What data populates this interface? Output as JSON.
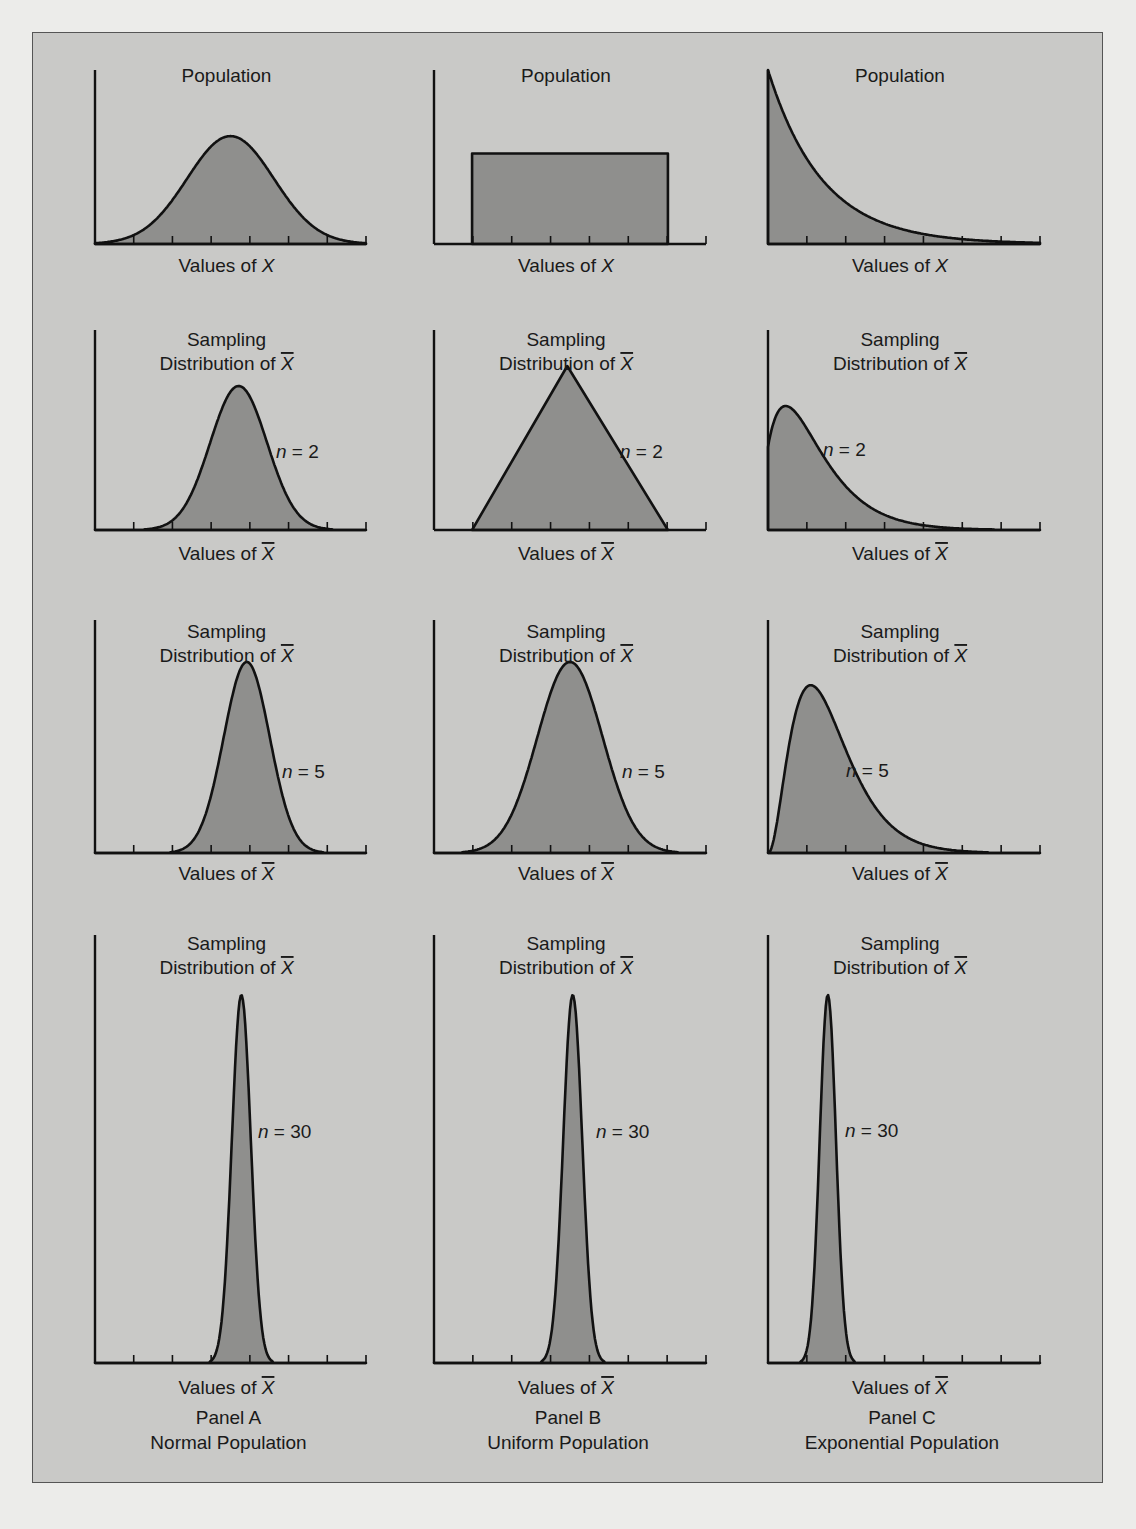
{
  "figure": {
    "columns": [
      {
        "panel": "Panel A",
        "population": "Normal Population"
      },
      {
        "panel": "Panel B",
        "population": "Uniform Population"
      },
      {
        "panel": "Panel C",
        "population": "Exponential Population"
      }
    ],
    "colors": {
      "fill": "#8f8f8d",
      "line": "#111111",
      "frame_bg": "#c9c9c7",
      "page_bg": "#ececea"
    }
  },
  "chart_data": [
    {
      "type": "area",
      "panel": "A",
      "row": 1,
      "title": "Population",
      "xlabel": "Values of X",
      "n": null,
      "shape": "normal",
      "peak_x_frac": 0.5,
      "spread": 0.16,
      "height_frac": 0.62
    },
    {
      "type": "area",
      "panel": "B",
      "row": 1,
      "title": "Population",
      "xlabel": "Values of X",
      "n": null,
      "shape": "uniform",
      "start_frac": 0.14,
      "end_frac": 0.86,
      "height_frac": 0.52
    },
    {
      "type": "area",
      "panel": "C",
      "row": 1,
      "title": "Population",
      "xlabel": "Values of X",
      "n": null,
      "shape": "exponential",
      "rate": 5.0,
      "height_frac": 1.0
    },
    {
      "type": "area",
      "panel": "A",
      "row": 2,
      "title": "Sampling Distribution of X̄",
      "xlabel": "Values of X̄",
      "n": 2,
      "shape": "normal",
      "peak_x_frac": 0.53,
      "spread": 0.105,
      "height_frac": 0.72
    },
    {
      "type": "area",
      "panel": "B",
      "row": 2,
      "title": "Sampling Distribution of X̄",
      "xlabel": "Values of X̄",
      "n": 2,
      "shape": "triangular",
      "start_frac": 0.14,
      "peak_x_frac": 0.49,
      "end_frac": 0.86,
      "height_frac": 0.82
    },
    {
      "type": "area",
      "panel": "C",
      "row": 2,
      "title": "Sampling Distribution of X̄",
      "xlabel": "Values of X̄",
      "n": 2,
      "shape": "gamma2",
      "peak_x_frac": 0.06,
      "height_frac": 0.62
    },
    {
      "type": "area",
      "panel": "A",
      "row": 3,
      "title": "Sampling Distribution of X̄",
      "xlabel": "Values of X̄",
      "n": 5,
      "shape": "normal",
      "peak_x_frac": 0.56,
      "spread": 0.085,
      "height_frac": 0.82
    },
    {
      "type": "area",
      "panel": "B",
      "row": 3,
      "title": "Sampling Distribution of X̄",
      "xlabel": "Values of X̄",
      "n": 5,
      "shape": "normal",
      "peak_x_frac": 0.5,
      "spread": 0.12,
      "height_frac": 0.82
    },
    {
      "type": "area",
      "panel": "C",
      "row": 3,
      "title": "Sampling Distribution of X̄",
      "xlabel": "Values of X̄",
      "n": 5,
      "shape": "gamma5",
      "peak_x_frac": 0.12,
      "height_frac": 0.72
    },
    {
      "type": "area",
      "panel": "A",
      "row": 4,
      "title": "Sampling Distribution of X̄",
      "xlabel": "Values of X̄",
      "n": 30,
      "shape": "normal_narrow",
      "peak_x_frac": 0.54,
      "spread": 0.035,
      "height_frac": 0.86
    },
    {
      "type": "area",
      "panel": "B",
      "row": 4,
      "title": "Sampling Distribution of X̄",
      "xlabel": "Values of X̄",
      "n": 30,
      "shape": "normal_narrow",
      "peak_x_frac": 0.51,
      "spread": 0.035,
      "height_frac": 0.86
    },
    {
      "type": "area",
      "panel": "C",
      "row": 4,
      "title": "Sampling Distribution of X̄",
      "xlabel": "Values of X̄",
      "n": 30,
      "shape": "normal_narrow",
      "peak_x_frac": 0.22,
      "spread": 0.03,
      "height_frac": 0.86
    }
  ],
  "labels": {
    "population": "Population",
    "sampling_line1": "Sampling",
    "sampling_line2": "Distribution of ",
    "xbar": "X",
    "values_of": "Values of ",
    "n_prefix": "n",
    "n_eq": " = "
  }
}
